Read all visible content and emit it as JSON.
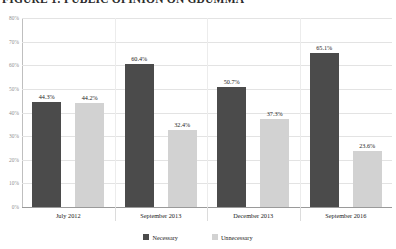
{
  "title": "FIGURE 1: PUBLIC OPINION ON GDUMMA",
  "legend": {
    "position": "bottom",
    "items": [
      {
        "label": "Necessary",
        "color": "#4b4b4b"
      },
      {
        "label": "Unnecessary",
        "color": "#d2d2d2"
      }
    ]
  },
  "axis": {
    "y_ticks": [
      "80%",
      "70%",
      "60%",
      "50%",
      "40%",
      "30%",
      "20%",
      "10%",
      "0%"
    ]
  },
  "chart_data": {
    "type": "bar",
    "title": "FIGURE 1: PUBLIC OPINION ON GDUMMA",
    "xlabel": "",
    "ylabel": "",
    "ylim": [
      0,
      80
    ],
    "ytick_step": 10,
    "ytick_labels": [
      "0%",
      "10%",
      "20%",
      "30%",
      "40%",
      "50%",
      "60%",
      "70%",
      "80%"
    ],
    "grid": true,
    "legend_position": "bottom",
    "categories": [
      "July 2012",
      "September 2013",
      "December 2013",
      "September 2016"
    ],
    "series": [
      {
        "name": "Necessary",
        "color": "#4b4b4b",
        "values": [
          44.3,
          60.4,
          50.7,
          65.1
        ],
        "labels": [
          "44.3%",
          "60.4%",
          "50.7%",
          "65.1%"
        ]
      },
      {
        "name": "Unnecessary",
        "color": "#d2d2d2",
        "values": [
          44.2,
          32.4,
          37.3,
          23.6
        ],
        "labels": [
          "44.2%",
          "32.4%",
          "37.3%",
          "23.6%"
        ]
      }
    ]
  }
}
